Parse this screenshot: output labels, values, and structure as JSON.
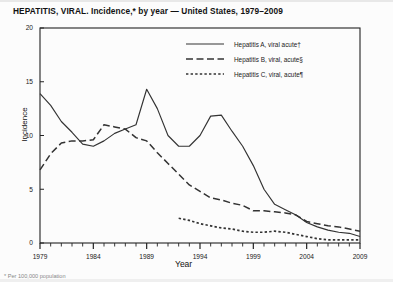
{
  "title": {
    "text": "HEPATITIS, VIRAL. Incidence,* by year — United States, 1979–2009"
  },
  "footnote": {
    "text": "* Per 100,000 population"
  },
  "axis": {
    "y_label": "Incidence",
    "x_label": "Year"
  },
  "chart_data": {
    "type": "line",
    "title": "HEPATITIS, VIRAL. Incidence,* by year — United States, 1979–2009",
    "xlabel": "Year",
    "ylabel": "Incidence",
    "xlim": [
      1979,
      2009
    ],
    "ylim": [
      0,
      20
    ],
    "yticks": [
      0,
      5,
      10,
      15,
      20
    ],
    "xticks": [
      1979,
      1984,
      1989,
      1994,
      1999,
      2004,
      2009
    ],
    "x_minor_tick_interval": 1,
    "grid": false,
    "legend_position": "top-center",
    "x": [
      1979,
      1980,
      1981,
      1982,
      1983,
      1984,
      1985,
      1986,
      1987,
      1988,
      1989,
      1990,
      1991,
      1992,
      1993,
      1994,
      1995,
      1996,
      1997,
      1998,
      1999,
      2000,
      2001,
      2002,
      2003,
      2004,
      2005,
      2006,
      2007,
      2008,
      2009
    ],
    "series": [
      {
        "name": "Hepatitis A, viral acute†",
        "style": "solid",
        "values": [
          13.9,
          12.8,
          11.3,
          10.3,
          9.2,
          9.0,
          9.5,
          10.2,
          10.6,
          11.0,
          14.3,
          12.5,
          10.0,
          9.0,
          9.0,
          10.0,
          11.8,
          11.9,
          10.4,
          9.0,
          7.2,
          5.0,
          3.6,
          3.1,
          2.6,
          1.9,
          1.5,
          1.2,
          1.0,
          0.9,
          0.6
        ]
      },
      {
        "name": "Hepatitis B, viral, acute§",
        "style": "dashed",
        "values": [
          6.8,
          8.3,
          9.3,
          9.5,
          9.5,
          9.6,
          11.0,
          10.8,
          10.6,
          9.8,
          9.5,
          8.4,
          7.4,
          6.4,
          5.4,
          4.8,
          4.2,
          4.0,
          3.7,
          3.5,
          3.0,
          3.0,
          2.9,
          2.8,
          2.6,
          2.0,
          1.8,
          1.6,
          1.5,
          1.3,
          1.1
        ]
      },
      {
        "name": "Hepatitis C, viral, acute¶",
        "style": "dotted",
        "values": [
          null,
          null,
          null,
          null,
          null,
          null,
          null,
          null,
          null,
          null,
          null,
          null,
          null,
          2.3,
          2.1,
          1.8,
          1.6,
          1.4,
          1.3,
          1.1,
          1.0,
          1.0,
          1.1,
          1.0,
          0.8,
          0.6,
          0.4,
          0.3,
          0.3,
          0.3,
          0.3
        ]
      }
    ]
  },
  "legend": {
    "items": [
      {
        "label": "Hepatitis A, viral acute†",
        "style": "solid"
      },
      {
        "label": "Hepatitis B, viral, acute§",
        "style": "dashed"
      },
      {
        "label": "Hepatitis C, viral, acute¶",
        "style": "dotted"
      }
    ]
  }
}
